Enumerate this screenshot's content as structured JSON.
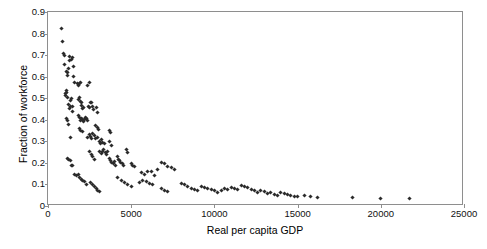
{
  "chart_data": {
    "type": "scatter",
    "title": "",
    "xlabel": "Real per capita GDP",
    "ylabel": "Fraction of workforce",
    "xlim": [
      0,
      25000
    ],
    "ylim": [
      0,
      0.9
    ],
    "xticks": [
      0,
      5000,
      10000,
      15000,
      20000,
      25000
    ],
    "xtick_labels": [
      "0",
      "5000",
      "10000",
      "15000",
      "20000",
      "25000"
    ],
    "yticks": [
      0,
      0.1,
      0.2,
      0.3,
      0.4,
      0.5,
      0.6,
      0.7,
      0.8,
      0.9
    ],
    "ytick_labels": [
      "0",
      "0.1",
      "0.2",
      "0.3",
      "0.4",
      "0.5",
      "0.6",
      "0.7",
      "0.8",
      "0.9"
    ],
    "grid": false,
    "legend": null,
    "marker": {
      "shape": "diamond",
      "color": "#2b2b2b",
      "size": 3
    },
    "series": [
      {
        "name": "countries",
        "points": [
          [
            820,
            0.822
          ],
          [
            900,
            0.762
          ],
          [
            960,
            0.706
          ],
          [
            980,
            0.697
          ],
          [
            1010,
            0.658
          ],
          [
            1120,
            0.625
          ],
          [
            1150,
            0.618
          ],
          [
            1180,
            0.606
          ],
          [
            1240,
            0.637
          ],
          [
            1300,
            0.676
          ],
          [
            1320,
            0.692
          ],
          [
            1400,
            0.681
          ],
          [
            1480,
            0.688
          ],
          [
            1520,
            0.645
          ],
          [
            1560,
            0.6
          ],
          [
            1620,
            0.575
          ],
          [
            1050,
            0.52
          ],
          [
            1080,
            0.512
          ],
          [
            1100,
            0.538
          ],
          [
            1140,
            0.528
          ],
          [
            1200,
            0.505
          ],
          [
            1250,
            0.47
          ],
          [
            1290,
            0.452
          ],
          [
            1330,
            0.462
          ],
          [
            1360,
            0.49
          ],
          [
            1420,
            0.497
          ],
          [
            1450,
            0.46
          ],
          [
            1490,
            0.44
          ],
          [
            1100,
            0.405
          ],
          [
            1160,
            0.395
          ],
          [
            1260,
            0.378
          ],
          [
            1380,
            0.318
          ],
          [
            1170,
            0.222
          ],
          [
            1250,
            0.218
          ],
          [
            1330,
            0.212
          ],
          [
            1400,
            0.19
          ],
          [
            1460,
            0.186
          ],
          [
            1600,
            0.148
          ],
          [
            1700,
            0.14
          ],
          [
            1780,
            0.566
          ],
          [
            1840,
            0.558
          ],
          [
            1900,
            0.57
          ],
          [
            1960,
            0.572
          ],
          [
            1820,
            0.495
          ],
          [
            1880,
            0.502
          ],
          [
            1930,
            0.486
          ],
          [
            1990,
            0.478
          ],
          [
            2020,
            0.468
          ],
          [
            2080,
            0.452
          ],
          [
            2140,
            0.455
          ],
          [
            1850,
            0.42
          ],
          [
            1900,
            0.41
          ],
          [
            1950,
            0.398
          ],
          [
            2000,
            0.405
          ],
          [
            2060,
            0.4
          ],
          [
            2110,
            0.392
          ],
          [
            2170,
            0.4
          ],
          [
            2230,
            0.412
          ],
          [
            2290,
            0.405
          ],
          [
            2350,
            0.396
          ],
          [
            1880,
            0.358
          ],
          [
            1960,
            0.352
          ],
          [
            2050,
            0.345
          ],
          [
            1820,
            0.148
          ],
          [
            1900,
            0.132
          ],
          [
            2000,
            0.125
          ],
          [
            2100,
            0.118
          ],
          [
            2200,
            0.112
          ],
          [
            2320,
            0.102
          ],
          [
            2400,
            0.56
          ],
          [
            2470,
            0.572
          ],
          [
            2420,
            0.46
          ],
          [
            2500,
            0.455
          ],
          [
            2560,
            0.478
          ],
          [
            2620,
            0.48
          ],
          [
            2700,
            0.462
          ],
          [
            2760,
            0.45
          ],
          [
            2400,
            0.318
          ],
          [
            2480,
            0.33
          ],
          [
            2560,
            0.322
          ],
          [
            2640,
            0.315
          ],
          [
            2700,
            0.338
          ],
          [
            2780,
            0.328
          ],
          [
            2840,
            0.312
          ],
          [
            2500,
            0.255
          ],
          [
            2600,
            0.24
          ],
          [
            2700,
            0.228
          ],
          [
            2820,
            0.218
          ],
          [
            2560,
            0.108
          ],
          [
            2680,
            0.098
          ],
          [
            2800,
            0.09
          ],
          [
            2920,
            0.08
          ],
          [
            3000,
            0.072
          ],
          [
            3120,
            0.065
          ],
          [
            2900,
            0.458
          ],
          [
            2980,
            0.432
          ],
          [
            2880,
            0.375
          ],
          [
            2960,
            0.362
          ],
          [
            3040,
            0.355
          ],
          [
            3000,
            0.318
          ],
          [
            3080,
            0.3
          ],
          [
            3160,
            0.292
          ],
          [
            3240,
            0.31
          ],
          [
            3300,
            0.296
          ],
          [
            3380,
            0.288
          ],
          [
            3100,
            0.255
          ],
          [
            3200,
            0.245
          ],
          [
            3280,
            0.252
          ],
          [
            3360,
            0.262
          ],
          [
            3440,
            0.248
          ],
          [
            3520,
            0.24
          ],
          [
            3600,
            0.255
          ],
          [
            3700,
            0.352
          ],
          [
            3780,
            0.34
          ],
          [
            3720,
            0.298
          ],
          [
            3800,
            0.282
          ],
          [
            3680,
            0.22
          ],
          [
            3760,
            0.212
          ],
          [
            3840,
            0.2
          ],
          [
            3920,
            0.195
          ],
          [
            4000,
            0.205
          ],
          [
            4080,
            0.19
          ],
          [
            4150,
            0.228
          ],
          [
            4220,
            0.218
          ],
          [
            4300,
            0.212
          ],
          [
            4380,
            0.2
          ],
          [
            4460,
            0.195
          ],
          [
            4540,
            0.19
          ],
          [
            4700,
            0.262
          ],
          [
            4800,
            0.25
          ],
          [
            5000,
            0.198
          ],
          [
            5100,
            0.19
          ],
          [
            5200,
            0.185
          ],
          [
            4200,
            0.132
          ],
          [
            4400,
            0.12
          ],
          [
            4600,
            0.108
          ],
          [
            4800,
            0.1
          ],
          [
            5000,
            0.092
          ],
          [
            5500,
            0.108
          ],
          [
            5700,
            0.118
          ],
          [
            5900,
            0.112
          ],
          [
            6100,
            0.105
          ],
          [
            6300,
            0.1
          ],
          [
            5600,
            0.155
          ],
          [
            5800,
            0.148
          ],
          [
            6000,
            0.162
          ],
          [
            6200,
            0.158
          ],
          [
            6400,
            0.14
          ],
          [
            6600,
            0.168
          ],
          [
            6800,
            0.2
          ],
          [
            7000,
            0.195
          ],
          [
            7200,
            0.185
          ],
          [
            7400,
            0.178
          ],
          [
            7600,
            0.168
          ],
          [
            6800,
            0.082
          ],
          [
            7000,
            0.072
          ],
          [
            7200,
            0.065
          ],
          [
            8000,
            0.105
          ],
          [
            8200,
            0.098
          ],
          [
            8400,
            0.092
          ],
          [
            8600,
            0.082
          ],
          [
            8800,
            0.078
          ],
          [
            9000,
            0.072
          ],
          [
            9200,
            0.092
          ],
          [
            9400,
            0.088
          ],
          [
            9600,
            0.082
          ],
          [
            9800,
            0.078
          ],
          [
            10000,
            0.07
          ],
          [
            10200,
            0.062
          ],
          [
            10400,
            0.072
          ],
          [
            10600,
            0.082
          ],
          [
            10800,
            0.078
          ],
          [
            11000,
            0.088
          ],
          [
            11200,
            0.08
          ],
          [
            11400,
            0.075
          ],
          [
            11600,
            0.095
          ],
          [
            11800,
            0.09
          ],
          [
            12000,
            0.085
          ],
          [
            12200,
            0.078
          ],
          [
            12400,
            0.07
          ],
          [
            12600,
            0.062
          ],
          [
            12800,
            0.07
          ],
          [
            13000,
            0.068
          ],
          [
            13200,
            0.058
          ],
          [
            13400,
            0.062
          ],
          [
            13600,
            0.055
          ],
          [
            13800,
            0.048
          ],
          [
            14000,
            0.062
          ],
          [
            14200,
            0.058
          ],
          [
            14400,
            0.052
          ],
          [
            14600,
            0.048
          ],
          [
            14800,
            0.045
          ],
          [
            15000,
            0.042
          ],
          [
            15400,
            0.048
          ],
          [
            15800,
            0.045
          ],
          [
            16200,
            0.04
          ],
          [
            18300,
            0.038
          ],
          [
            20000,
            0.036
          ],
          [
            21700,
            0.034
          ]
        ]
      }
    ]
  },
  "axes": {
    "plot_left_px": 47,
    "plot_top_px": 11,
    "plot_width_px": 416,
    "plot_height_px": 194
  }
}
